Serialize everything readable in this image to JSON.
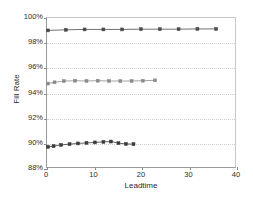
{
  "chart_data": {
    "type": "line",
    "title": "",
    "xlabel": "Leadtime",
    "ylabel": "Fill Rate",
    "xlim": [
      0,
      40
    ],
    "ylim": [
      88,
      100
    ],
    "xticks": [
      0,
      10,
      20,
      30,
      40
    ],
    "xtick_labels": [
      "0",
      "10",
      "20",
      "30",
      "40"
    ],
    "yticks": [
      88,
      90,
      92,
      94,
      96,
      98,
      100
    ],
    "ytick_labels": [
      "88%",
      "90%",
      "92%",
      "94%",
      "96%",
      "98%",
      "100%"
    ],
    "grid": "horizontal-dotted",
    "legend": "none",
    "series": [
      {
        "name": "top-series",
        "color": "#4a4a4a",
        "marker": "square",
        "x": [
          0.2,
          4.0,
          8.0,
          12.0,
          16.0,
          20.0,
          24.0,
          28.0,
          32.0,
          36.0
        ],
        "values": [
          99.0,
          99.05,
          99.08,
          99.08,
          99.08,
          99.1,
          99.1,
          99.1,
          99.12,
          99.12
        ]
      },
      {
        "name": "middle-series",
        "color": "#8a8a8a",
        "marker": "square",
        "x": [
          0.2,
          1.6,
          3.6,
          6.0,
          8.4,
          10.8,
          13.2,
          15.6,
          18.0,
          20.4,
          23.0
        ],
        "values": [
          94.72,
          94.82,
          94.92,
          94.95,
          94.93,
          94.95,
          94.93,
          94.92,
          94.93,
          94.95,
          94.98
        ]
      },
      {
        "name": "bottom-series",
        "color": "#3a3a3a",
        "marker": "square",
        "x": [
          0.2,
          1.4,
          3.0,
          4.8,
          6.6,
          8.4,
          10.2,
          12.0,
          13.6,
          15.2,
          16.8,
          18.4
        ],
        "values": [
          89.62,
          89.68,
          89.78,
          89.84,
          89.9,
          89.94,
          89.98,
          90.02,
          90.05,
          89.92,
          89.86,
          89.84
        ]
      }
    ]
  }
}
